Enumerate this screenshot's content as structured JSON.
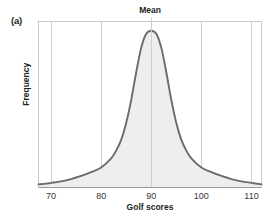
{
  "figure": {
    "panel_label": "(a)",
    "title": "Mean",
    "xlabel": "Golf scores",
    "ylabel": "Frequency"
  },
  "colors": {
    "curve": "#6b6b6b",
    "fill": "#eeeeee",
    "grid": "#cfcfcf",
    "axis": "#b5b5b5",
    "text": "#231f20",
    "background": "#ffffff"
  },
  "chart_data": {
    "type": "area",
    "title": "Mean",
    "xlabel": "Golf scores",
    "ylabel": "Frequency",
    "xlim": [
      67.5,
      112
    ],
    "ylim": [
      0,
      1.08
    ],
    "grid": true,
    "legend": null,
    "xticks": [
      70,
      80,
      90,
      100,
      110
    ],
    "xtick_labels": [
      "70",
      "80",
      "90",
      "100",
      "110"
    ],
    "yticks": [],
    "ytick_labels": [],
    "annotations": [
      {
        "label": "Mean",
        "x": 90,
        "type": "vertical-line-with-top-label"
      }
    ],
    "series": [
      {
        "name": "Golf score distribution",
        "x": [
          67.5,
          69,
          70,
          72,
          74,
          76,
          78,
          80,
          82,
          83,
          84,
          85,
          86,
          87,
          88,
          89,
          90,
          91,
          92,
          93,
          94,
          95,
          96,
          97,
          98,
          100,
          102,
          104,
          106,
          108,
          110,
          112
        ],
        "y": [
          0.02,
          0.025,
          0.03,
          0.04,
          0.055,
          0.075,
          0.1,
          0.13,
          0.19,
          0.24,
          0.31,
          0.42,
          0.57,
          0.75,
          0.91,
          1.0,
          1.02,
          1.0,
          0.91,
          0.75,
          0.57,
          0.42,
          0.31,
          0.24,
          0.19,
          0.13,
          0.1,
          0.075,
          0.055,
          0.04,
          0.03,
          0.02
        ]
      }
    ]
  }
}
